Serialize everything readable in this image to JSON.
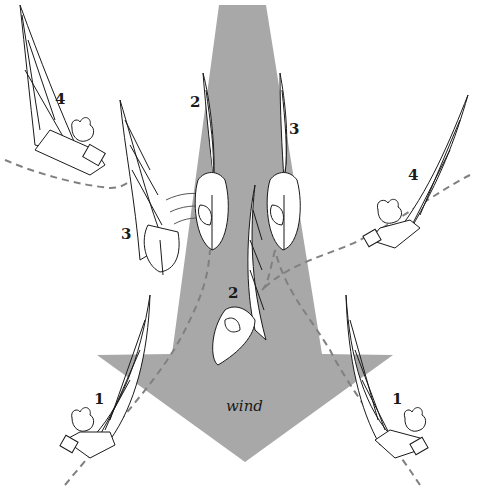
{
  "diagram": {
    "wind_arrow": {
      "label": "wind",
      "color": "#a8a8a8",
      "direction": "down"
    },
    "track_color": "#808080",
    "boats": [
      {
        "id": "boat-left-1",
        "position_label": "1",
        "side": "left"
      },
      {
        "id": "boat-left-2",
        "position_label": "2",
        "side": "left"
      },
      {
        "id": "boat-left-3",
        "position_label": "3",
        "side": "left"
      },
      {
        "id": "boat-left-4",
        "position_label": "4",
        "side": "left"
      },
      {
        "id": "boat-right-1",
        "position_label": "1",
        "side": "right"
      },
      {
        "id": "boat-right-2",
        "position_label": "2",
        "side": "right"
      },
      {
        "id": "boat-right-3",
        "position_label": "3",
        "side": "right"
      },
      {
        "id": "boat-right-4",
        "position_label": "4",
        "side": "right"
      }
    ]
  }
}
